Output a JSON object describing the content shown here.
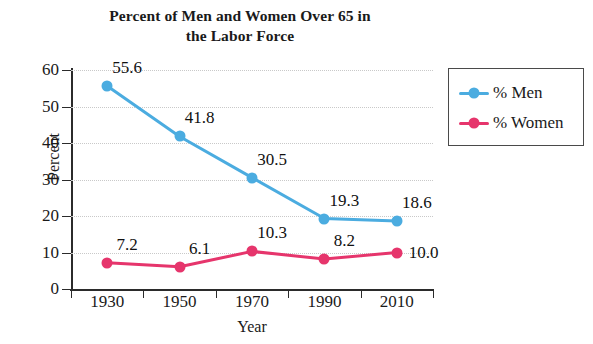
{
  "chart_data": {
    "type": "line",
    "title": "Percent of Men and Women Over 65 in the Labor Force",
    "title_lines": [
      "Percent of Men and Women Over 65 in",
      "the Labor Force"
    ],
    "xlabel": "Year",
    "ylabel": "Percent",
    "categories": [
      "1930",
      "1950",
      "1970",
      "1990",
      "2010"
    ],
    "ylim": [
      0,
      60
    ],
    "yticks": [
      "0",
      "10",
      "20",
      "30",
      "40",
      "50",
      "60"
    ],
    "grid": "horizontal-dotted",
    "legend_position": "top-right",
    "series": [
      {
        "name": "% Men",
        "color": "#4bace0",
        "values": [
          55.6,
          41.8,
          30.5,
          19.3,
          18.6
        ],
        "labels": [
          "55.6",
          "41.8",
          "30.5",
          "19.3",
          "18.6"
        ],
        "label_placement": [
          "above",
          "above",
          "above",
          "above",
          "above"
        ]
      },
      {
        "name": "% Women",
        "color": "#e6356c",
        "values": [
          7.2,
          6.1,
          10.3,
          8.2,
          10.0
        ],
        "labels": [
          "7.2",
          "6.1",
          "10.3",
          "8.2",
          "10.0"
        ],
        "label_placement": [
          "above",
          "above",
          "above",
          "above",
          "right"
        ]
      }
    ]
  },
  "legend": {
    "items": [
      {
        "label": "% Men",
        "color": "#4bace0"
      },
      {
        "label": "% Women",
        "color": "#e6356c"
      }
    ]
  }
}
